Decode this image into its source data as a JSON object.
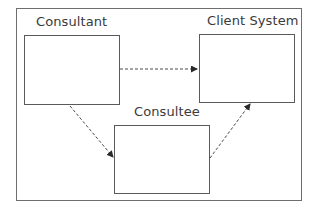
{
  "diagram": {
    "type": "flow",
    "nodes": [
      {
        "id": "consultant",
        "label": "Consultant"
      },
      {
        "id": "client_system",
        "label": "Client System"
      },
      {
        "id": "consultee",
        "label": "Consultee"
      }
    ],
    "edges": [
      {
        "from": "consultant",
        "to": "client_system",
        "style": "dashed",
        "arrow": "end"
      },
      {
        "from": "consultant",
        "to": "consultee",
        "style": "dashed",
        "arrow": "end"
      },
      {
        "from": "consultee",
        "to": "client_system",
        "style": "dashed",
        "arrow": "end"
      }
    ],
    "colors": {
      "line": "#5a5a5a",
      "text": "#3a3a3a",
      "background": "#ffffff"
    }
  }
}
